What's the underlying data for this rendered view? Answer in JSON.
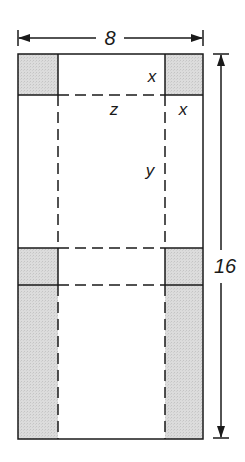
{
  "diagram": {
    "type": "box-net-cutout",
    "colors": {
      "stroke": "#1a1a1a",
      "shade": "#d8d8d8",
      "background": "#ffffff"
    },
    "dimensions": {
      "width_label": "8",
      "height_label": "16"
    },
    "labels": {
      "x_top": "x",
      "z": "z",
      "x_side": "x",
      "y": "y"
    }
  }
}
